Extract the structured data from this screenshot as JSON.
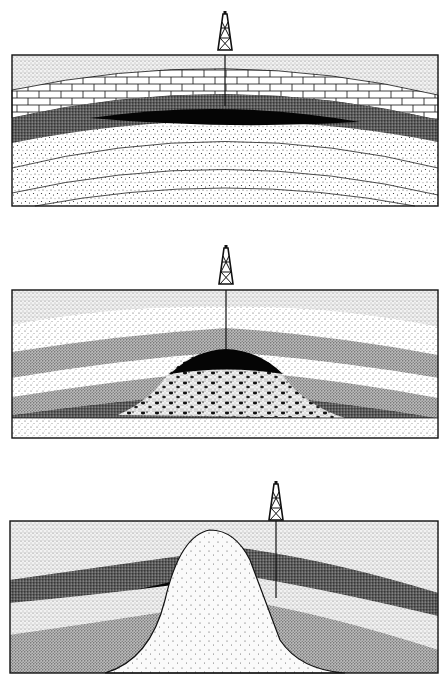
{
  "figure": {
    "type": "geological cross-sections of petroleum traps",
    "panels": [
      {
        "id": "anticline-trap",
        "layers": [
          "light stippled surface layer",
          "limestone brick layer",
          "dark reservoir layer with oil",
          "coarse stippled lower layers"
        ],
        "derrick": {
          "x": 225
        }
      },
      {
        "id": "reef-trap",
        "layers": [
          "light stippled layers",
          "medium stippled layers",
          "dark layers",
          "mottled reef mound with oil cap",
          "basal light layer"
        ],
        "derrick": {
          "x": 226
        }
      },
      {
        "id": "salt-dome-trap",
        "layers": [
          "medium stippled surface layer",
          "dark reservoir layer with oil",
          "light layer",
          "medium lower layers",
          "salt dome intrusion"
        ],
        "derrick": {
          "x": 276
        }
      }
    ]
  },
  "colors": {
    "ink": "#111111",
    "paper": "#ffffff",
    "oil": "#050505"
  }
}
